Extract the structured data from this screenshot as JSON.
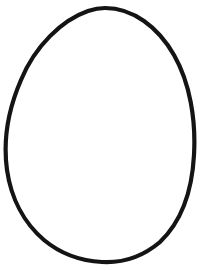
{
  "page": {
    "title": "Egg Outline Coloring Page",
    "width": 207,
    "height": 271,
    "background_color": "#ffffff",
    "content_type": "line-art"
  },
  "artwork": {
    "name": "egg-outline",
    "description": "Egg outline drawing",
    "shape": "egg",
    "stroke_color": "#141414",
    "fill_color": "#ffffff",
    "stroke_width": 4.2,
    "geometry": {
      "top_apex": {
        "x": 105,
        "y": 8
      },
      "bottom_apex": {
        "x": 102,
        "y": 262
      },
      "left_extreme": {
        "x": 6,
        "y": 170
      },
      "right_extreme": {
        "x": 194,
        "y": 162
      },
      "width": 188,
      "height": 254,
      "path": "M 105 8 C 133 8 158 27 174 55 C 190 83 196 120 194 155 C 192 192 181 222 160 242 C 140 259 120 263 102 262 C 83 261 62 255 44 240 C 24 223 11 198 7 170 C 3 141 8 110 21 80 C 35 46 62 20 88 11 C 94 9 100 8 105 8 Z"
    }
  }
}
